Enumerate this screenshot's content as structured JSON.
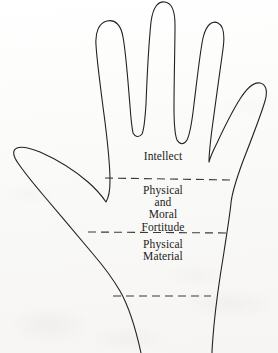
{
  "figure": {
    "background_color": "#fbfbfa",
    "ink_color": "#222222",
    "line_width": 1.1,
    "zones": [
      {
        "id": "intellect",
        "name": "Intellect",
        "lines": [
          "Intellect"
        ],
        "region": "fingers-and-upper-palm"
      },
      {
        "id": "physical-and-moral-fortitude",
        "name": "Physical and Moral Fortitude",
        "lines": [
          "Physical",
          "and",
          "Moral",
          "Fortitude"
        ],
        "region": "mid-palm"
      },
      {
        "id": "physical-material",
        "name": "Physical Material",
        "lines": [
          "Physical",
          "Material"
        ],
        "region": "lower-palm"
      }
    ],
    "dividers": [
      {
        "id": "divider-upper",
        "style": "dashed",
        "y": 178,
        "x_start": 105,
        "x_end": 233
      },
      {
        "id": "divider-middle",
        "style": "dashed",
        "y": 232,
        "x_start": 88,
        "x_end": 229
      },
      {
        "id": "divider-lower",
        "style": "dashed",
        "y": 296,
        "x_start": 113,
        "x_end": 211
      }
    ],
    "parts": [
      {
        "id": "thumb",
        "label": "thumb"
      },
      {
        "id": "index-finger",
        "label": "index finger"
      },
      {
        "id": "middle-finger",
        "label": "middle finger"
      },
      {
        "id": "ring-finger",
        "label": "ring finger"
      },
      {
        "id": "little-finger",
        "label": "little finger"
      },
      {
        "id": "palm",
        "label": "palm"
      },
      {
        "id": "wrist",
        "label": "wrist"
      }
    ]
  }
}
